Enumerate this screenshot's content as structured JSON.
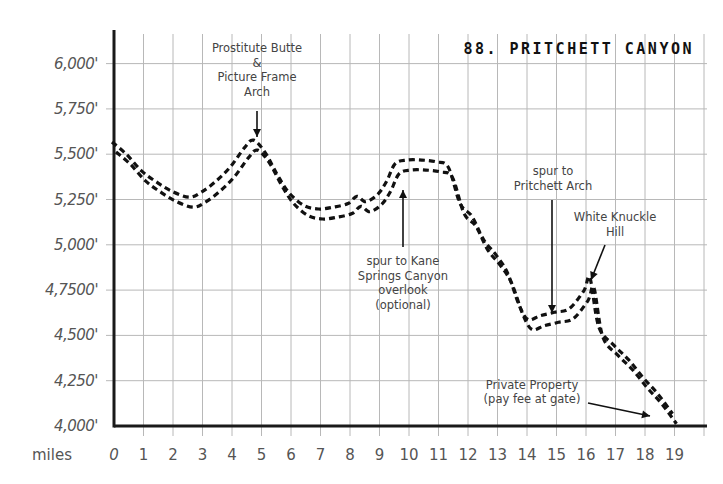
{
  "chart_data": {
    "type": "line",
    "title": "88. PRITCHETT CANYON",
    "xlabel": "miles",
    "ylabel": "",
    "x_ticks": [
      "0",
      "1",
      "2",
      "3",
      "4",
      "5",
      "6",
      "7",
      "8",
      "9",
      "10",
      "11",
      "12",
      "13",
      "14",
      "15",
      "16",
      "17",
      "18",
      "19"
    ],
    "y_ticks": [
      "4,000'",
      "4,250'",
      "4,500'",
      "4,7500'",
      "5,000'",
      "5,250'",
      "5,500'",
      "5,750'",
      "6,000'"
    ],
    "ylim": [
      4000,
      6125
    ],
    "xlim": [
      0,
      20.2
    ],
    "grid": true,
    "line_style": "double dashed",
    "series": [
      {
        "name": "Elevation profile",
        "x": [
          0,
          0.5,
          1,
          1.5,
          2,
          2.6,
          3,
          3.5,
          4,
          4.5,
          4.8,
          5.2,
          5.6,
          6,
          6.5,
          7,
          7.5,
          8,
          8.3,
          8.6,
          9,
          9.3,
          9.6,
          10,
          10.5,
          11,
          11.4,
          11.8,
          12.2,
          12.6,
          13,
          13.4,
          13.8,
          14.1,
          14.5,
          15,
          15.5,
          16,
          16.2,
          16.5,
          17,
          17.5,
          18,
          18.5,
          19
        ],
        "values": [
          5540,
          5470,
          5380,
          5320,
          5270,
          5235,
          5260,
          5320,
          5400,
          5510,
          5550,
          5480,
          5360,
          5260,
          5190,
          5170,
          5180,
          5200,
          5240,
          5210,
          5250,
          5320,
          5420,
          5440,
          5440,
          5430,
          5400,
          5200,
          5130,
          5000,
          4920,
          4820,
          4640,
          4560,
          4580,
          4600,
          4620,
          4720,
          4790,
          4520,
          4420,
          4340,
          4240,
          4150,
          4040
        ]
      }
    ],
    "annotations": [
      {
        "text": "Prostitute Butte & Picture Frame Arch",
        "x": 4.8,
        "y": 5550,
        "arrow": "down"
      },
      {
        "text": "spur to Kane Springs Canyon overlook (optional)",
        "x": 9.7,
        "y": 5420,
        "arrow": "up"
      },
      {
        "text": "spur to Pritchett Arch",
        "x": 14.9,
        "y": 4600,
        "arrow": "down"
      },
      {
        "text": "White Knuckle Hill",
        "x": 16.2,
        "y": 4780,
        "arrow": "down-left"
      },
      {
        "text": "Private Property (pay fee at gate)",
        "x": 18.6,
        "y": 4030,
        "arrow": "right"
      }
    ],
    "legend": "none"
  },
  "labels": {
    "title": "88. PRITCHETT CANYON",
    "x_axis_name": "miles",
    "ann1": [
      "Prostitute Butte",
      "&",
      "Picture Frame",
      "Arch"
    ],
    "ann2": [
      "spur to Kane",
      "Springs Canyon",
      "overlook",
      "(optional)"
    ],
    "ann3": [
      "spur to",
      "Pritchett Arch"
    ],
    "ann4": [
      "White Knuckle",
      "Hill"
    ],
    "ann5": [
      "Private Property",
      "(pay fee at gate)"
    ]
  },
  "colors": {
    "grid": "#b8b8b8",
    "axis": "#1a1a1a",
    "trail": "#111111",
    "text": "#555555"
  }
}
